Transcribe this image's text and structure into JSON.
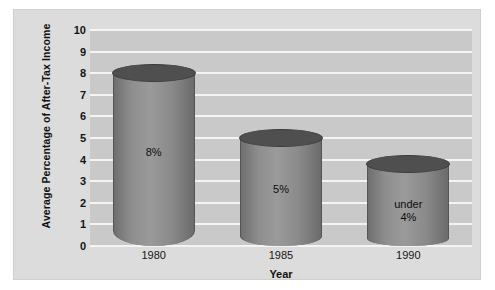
{
  "chart_data": {
    "type": "bar",
    "title": "",
    "subtitle": "",
    "xlabel": "Year",
    "ylabel": "Average Percentage of After-Tax Income",
    "categories": [
      "1980",
      "1985",
      "1990"
    ],
    "values": [
      8,
      5,
      3.8
    ],
    "data_labels": [
      "8%",
      "5%",
      "under\n4%"
    ],
    "ylim": [
      0,
      10
    ],
    "yticks": [
      "0",
      "1",
      "2",
      "3",
      "4",
      "5",
      "6",
      "7",
      "8",
      "9",
      "10"
    ],
    "ytick_values": [
      0,
      1,
      2,
      3,
      4,
      5,
      6,
      7,
      8,
      9,
      10
    ],
    "grid": true,
    "legend": "none",
    "style": {
      "plot_background": "#c9c9c9",
      "figure_background": "#dcdcdc",
      "gridline_color": "#f4f4f4",
      "bar_color": "#8e8e8e",
      "bar_top_color": "#4f4f4f",
      "text_color": "#111111"
    }
  }
}
